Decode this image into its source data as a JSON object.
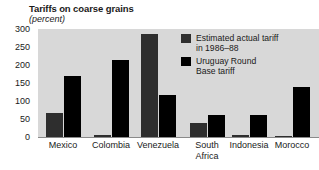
{
  "chart_data": {
    "type": "bar",
    "title": "Tariffs on coarse grains",
    "subtitle": "(percent)",
    "xlabel": "",
    "ylabel": "",
    "ylim": [
      0,
      300
    ],
    "yticks": [
      0,
      50,
      100,
      150,
      200,
      250,
      300
    ],
    "ytick_labels": [
      "0",
      "50",
      "100",
      "150",
      "200",
      "250",
      "300"
    ],
    "grid": false,
    "legend_position": "inside-top-right",
    "categories": [
      "Mexico",
      "Colombia",
      "Venezuela",
      "South\nAfrica",
      "Indonesia",
      "Morocco"
    ],
    "series": [
      {
        "name": "Estimated actual tariff\nin 1986–88",
        "color": "#2e2e2e",
        "values": [
          68,
          6,
          285,
          40,
          5,
          4
        ]
      },
      {
        "name": "Uruguay Round\nBase tariff",
        "color": "#000000",
        "values": [
          170,
          215,
          118,
          62,
          60,
          140
        ]
      }
    ]
  },
  "legend": {
    "entries": [
      {
        "label": "Estimated actual tariff\nin 1986–88",
        "swatch": "actual"
      },
      {
        "label": "Uruguay Round\nBase tariff",
        "swatch": "uruguay"
      }
    ]
  },
  "colors": {
    "plot_background": "#d8d8d8",
    "page_background": "#ffffff",
    "actual_series": "#2e2e2e",
    "uruguay_series": "#000000",
    "text": "#1a1a1a",
    "axis": "#8a8a8a"
  }
}
